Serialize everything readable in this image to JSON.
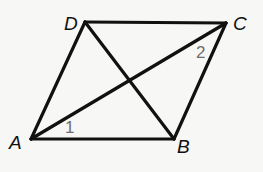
{
  "figure": {
    "type": "parallelogram-with-diagonals",
    "background": "#f7f7f5",
    "stroke_color": "#111111",
    "angle_label_color": "#6e6e6e",
    "vertices": [
      {
        "id": "A",
        "label": "A",
        "x": 31,
        "y": 139
      },
      {
        "id": "B",
        "label": "B",
        "x": 174,
        "y": 139
      },
      {
        "id": "C",
        "label": "C",
        "x": 226,
        "y": 23
      },
      {
        "id": "D",
        "label": "D",
        "x": 85,
        "y": 22
      }
    ],
    "sides": [
      "AB",
      "BC",
      "CD",
      "DA"
    ],
    "diagonals": [
      "AC",
      "BD"
    ],
    "angle_labels": [
      {
        "label": "1",
        "at_vertex": "A",
        "between": [
          "AB",
          "AC"
        ]
      },
      {
        "label": "2",
        "at_vertex": "C",
        "between": [
          "CA",
          "CB"
        ]
      }
    ]
  },
  "labels": {
    "A": "A",
    "B": "B",
    "C": "C",
    "D": "D",
    "angle1": "1",
    "angle2": "2"
  }
}
